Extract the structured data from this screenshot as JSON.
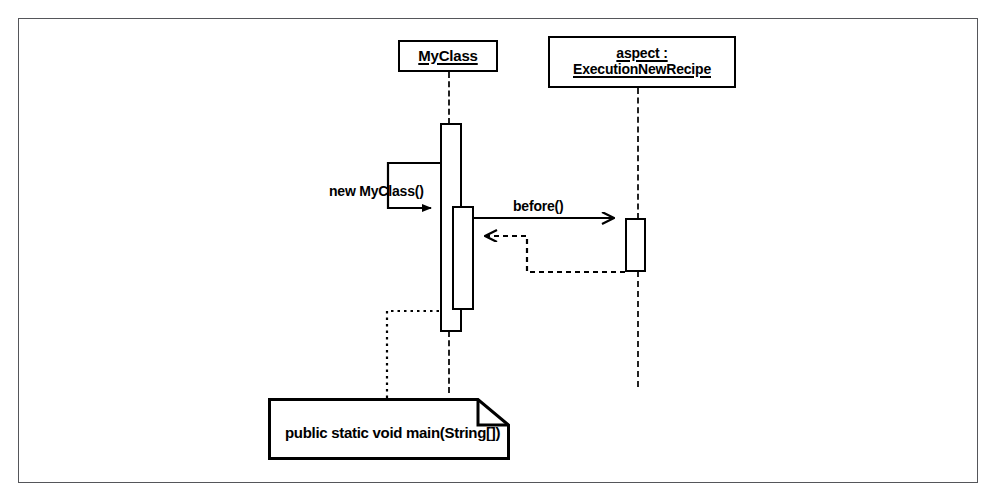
{
  "diagram": {
    "type": "uml-sequence-diagram",
    "border_color": "#55565a",
    "line_color": "#000000",
    "background": "#ffffff"
  },
  "participants": [
    {
      "id": "myclass",
      "label_line1": "MyClass",
      "label_line2": "",
      "box": {
        "x": 398,
        "y": 40,
        "width": 100,
        "height": 32
      },
      "lifeline_x": 449
    },
    {
      "id": "aspect",
      "label_line1": "aspect :",
      "label_line2": "ExecutionNewRecipe",
      "box": {
        "x": 548,
        "y": 36,
        "width": 188,
        "height": 52
      },
      "lifeline_x": 638
    }
  ],
  "activations": [
    {
      "id": "myclass-activation-outer",
      "x": 440,
      "y": 123,
      "width": 22,
      "height": 209
    },
    {
      "id": "myclass-activation-inner",
      "x": 452,
      "y": 206,
      "width": 22,
      "height": 104
    },
    {
      "id": "aspect-activation",
      "x": 625,
      "y": 218,
      "width": 21,
      "height": 54
    }
  ],
  "messages": [
    {
      "id": "new-myclass",
      "label": "new MyClass()",
      "style": "solid",
      "arrowhead": "filled",
      "label_x": 329,
      "label_y": 193
    },
    {
      "id": "before",
      "label": "before()",
      "style": "solid",
      "arrowhead": "open",
      "label_x": 513,
      "label_y": 212
    },
    {
      "id": "before-return",
      "label": "",
      "style": "dashed",
      "arrowhead": "open",
      "label_x": 0,
      "label_y": 0
    }
  ],
  "note": {
    "id": "main-method-note",
    "text": "public static void main(String[])",
    "box": {
      "x": 268,
      "y": 398,
      "width": 242,
      "height": 62
    },
    "fold_size": 32,
    "text_x": 285,
    "text_y": 434,
    "connector_style": "dotted"
  }
}
